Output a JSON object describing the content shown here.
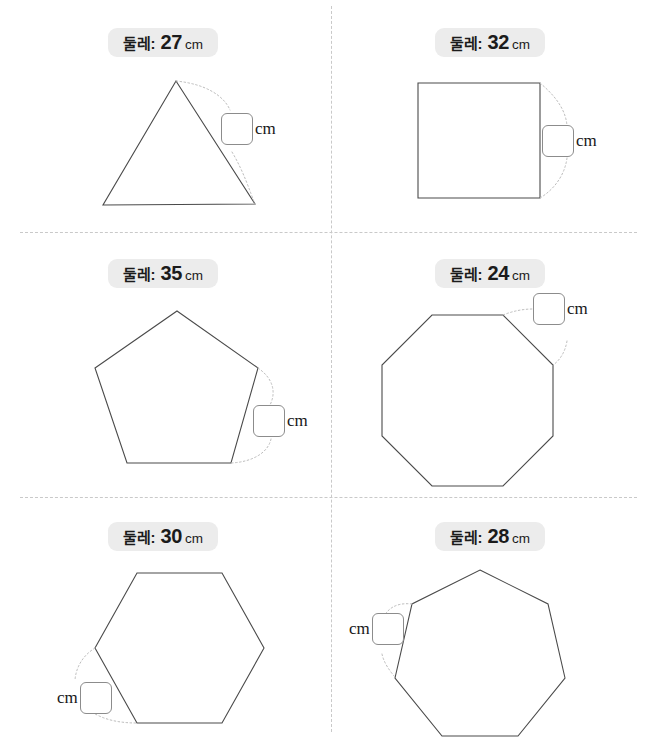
{
  "worksheet": {
    "unit_label": "cm",
    "perimeter_label": "둘레:",
    "answer_placeholder": "",
    "accent_pill_bg": "#ececec",
    "shape_stroke": "#4a4a4a",
    "leader_stroke": "#bdbdbd",
    "divider_stroke": "#c9c9c9"
  },
  "panels": [
    {
      "id": "triangle",
      "shape_name": "triangle",
      "sides": 3,
      "perimeter_label": "둘레:",
      "perimeter_value": "27",
      "perimeter_unit": "cm",
      "answer_value": "",
      "answer_unit": "cm",
      "answer_side": "right"
    },
    {
      "id": "square",
      "shape_name": "square",
      "sides": 4,
      "perimeter_label": "둘레:",
      "perimeter_value": "32",
      "perimeter_unit": "cm",
      "answer_value": "",
      "answer_unit": "cm",
      "answer_side": "right"
    },
    {
      "id": "pentagon",
      "shape_name": "pentagon",
      "sides": 5,
      "perimeter_label": "둘레:",
      "perimeter_value": "35",
      "perimeter_unit": "cm",
      "answer_value": "",
      "answer_unit": "cm",
      "answer_side": "right"
    },
    {
      "id": "octagon",
      "shape_name": "octagon",
      "sides": 8,
      "perimeter_label": "둘레:",
      "perimeter_value": "24",
      "perimeter_unit": "cm",
      "answer_value": "",
      "answer_unit": "cm",
      "answer_side": "right"
    },
    {
      "id": "hexagon",
      "shape_name": "hexagon",
      "sides": 6,
      "perimeter_label": "둘레:",
      "perimeter_value": "30",
      "perimeter_unit": "cm",
      "answer_value": "",
      "answer_unit": "cm",
      "answer_side": "left"
    },
    {
      "id": "heptagon",
      "shape_name": "heptagon",
      "sides": 7,
      "perimeter_label": "둘레:",
      "perimeter_value": "28",
      "perimeter_unit": "cm",
      "answer_value": "",
      "answer_unit": "cm",
      "answer_side": "left"
    }
  ]
}
